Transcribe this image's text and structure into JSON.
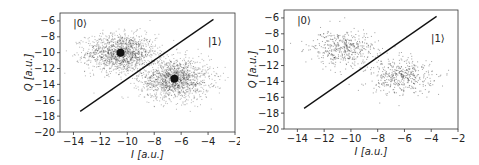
{
  "chart_data": [
    {
      "type": "scatter",
      "title": "",
      "xlabel": "I [a.u.]",
      "ylabel": "Q [a.u.]",
      "xlim": [
        -15,
        -2
      ],
      "ylim": [
        -20,
        -5
      ],
      "xticks": [
        -14,
        -12,
        -10,
        -8,
        -6,
        -4,
        -2
      ],
      "yticks": [
        -6,
        -8,
        -10,
        -12,
        -14,
        -16,
        -18,
        -20
      ],
      "grid": false,
      "annotations": [
        {
          "text": "|0⟩",
          "x": -13.5,
          "y": -6.8
        },
        {
          "text": "|1⟩",
          "x": -3.5,
          "y": -9.0
        }
      ],
      "decision_boundary": {
        "x": [
          -13.5,
          -3.6
        ],
        "y": [
          -17.4,
          -5.8
        ]
      },
      "series": [
        {
          "name": "|0> cluster",
          "center": [
            -10.5,
            -10.0
          ],
          "spread": [
            1.3,
            1.2
          ],
          "density": "high",
          "centroid_marker": true
        },
        {
          "name": "|1> cluster",
          "center": [
            -6.5,
            -13.3
          ],
          "spread": [
            1.3,
            1.3
          ],
          "density": "high",
          "centroid_marker": true
        }
      ]
    },
    {
      "type": "scatter",
      "title": "",
      "xlabel": "I [a.u.]",
      "ylabel": "Q [a.u.]",
      "xlim": [
        -15,
        -2
      ],
      "ylim": [
        -20,
        -5
      ],
      "xticks": [
        -14,
        -12,
        -10,
        -8,
        -6,
        -4,
        -2
      ],
      "yticks": [
        -6,
        -8,
        -10,
        -12,
        -14,
        -16,
        -18,
        -20
      ],
      "grid": false,
      "annotations": [
        {
          "text": "|0⟩",
          "x": -13.5,
          "y": -6.8
        },
        {
          "text": "|1⟩",
          "x": -3.5,
          "y": -9.0
        }
      ],
      "decision_boundary": {
        "x": [
          -13.5,
          -3.6
        ],
        "y": [
          -17.4,
          -5.8
        ]
      },
      "series": [
        {
          "name": "|0> cluster",
          "center": [
            -10.7,
            -9.8
          ],
          "spread": [
            1.2,
            1.1
          ],
          "density": "low",
          "centroid_marker": false
        },
        {
          "name": "|1> cluster",
          "center": [
            -6.3,
            -13.3
          ],
          "spread": [
            1.3,
            1.2
          ],
          "density": "low",
          "centroid_marker": false
        }
      ]
    }
  ]
}
